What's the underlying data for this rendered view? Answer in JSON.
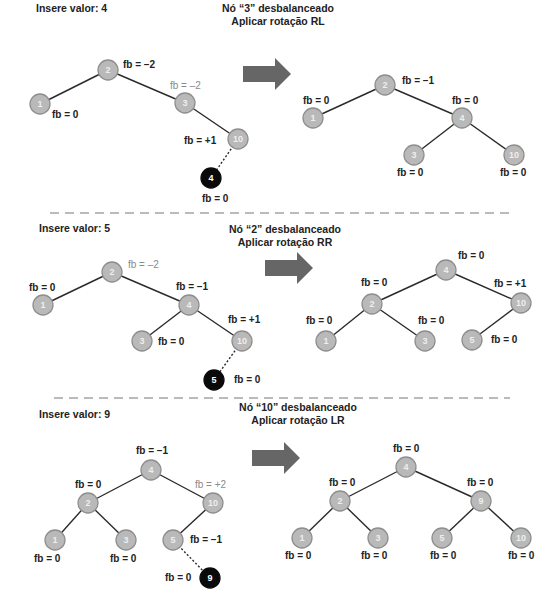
{
  "panels": [
    {
      "title": "Insere valor: 4",
      "heading_line1": "Nó “3” desbalanceado",
      "heading_line2": "Aplicar rotação RL",
      "before": {
        "nodes": [
          {
            "v": "2",
            "x": 108,
            "y": 70
          },
          {
            "v": "1",
            "x": 40,
            "y": 104
          },
          {
            "v": "3",
            "x": 185,
            "y": 103
          },
          {
            "v": "10",
            "x": 238,
            "y": 139
          },
          {
            "v": "4",
            "x": 211,
            "y": 178,
            "new": true
          }
        ],
        "edges": [
          [
            0,
            1
          ],
          [
            0,
            2
          ],
          [
            2,
            3
          ],
          [
            3,
            4,
            "dotted"
          ]
        ],
        "labels": [
          {
            "t": "fb = –2",
            "x": 123,
            "y": 68
          },
          {
            "t": "fb = –2",
            "x": 170,
            "y": 89,
            "grey": true
          },
          {
            "t": "fb = 0",
            "x": 52,
            "y": 118
          },
          {
            "t": "fb = +1",
            "x": 184,
            "y": 144
          },
          {
            "t": "fb = 0",
            "x": 202,
            "y": 202
          }
        ]
      },
      "after": {
        "nodes": [
          {
            "v": "2",
            "x": 385,
            "y": 85
          },
          {
            "v": "1",
            "x": 313,
            "y": 118
          },
          {
            "v": "4",
            "x": 462,
            "y": 118
          },
          {
            "v": "3",
            "x": 414,
            "y": 155
          },
          {
            "v": "10",
            "x": 514,
            "y": 155
          }
        ],
        "edges": [
          [
            0,
            1
          ],
          [
            0,
            2
          ],
          [
            2,
            3
          ],
          [
            2,
            4
          ]
        ],
        "labels": [
          {
            "t": "fb = –1",
            "x": 402,
            "y": 84
          },
          {
            "t": "fb = 0",
            "x": 303,
            "y": 104
          },
          {
            "t": "fb = 0",
            "x": 452,
            "y": 104
          },
          {
            "t": "fb = 0",
            "x": 397,
            "y": 176
          },
          {
            "t": "fb = 0",
            "x": 500,
            "y": 176
          }
        ]
      },
      "arrow": {
        "x": 243,
        "y": 58
      }
    },
    {
      "title": "Insere valor: 5",
      "heading_line1": "Nó “2” desbalanceado",
      "heading_line2": "Aplicar rotação RR",
      "before": {
        "nodes": [
          {
            "v": "2",
            "x": 112,
            "y": 272
          },
          {
            "v": "1",
            "x": 43,
            "y": 305
          },
          {
            "v": "4",
            "x": 189,
            "y": 305
          },
          {
            "v": "3",
            "x": 142,
            "y": 341
          },
          {
            "v": "10",
            "x": 242,
            "y": 341
          },
          {
            "v": "5",
            "x": 214,
            "y": 380,
            "new": true
          }
        ],
        "edges": [
          [
            0,
            1
          ],
          [
            0,
            2
          ],
          [
            2,
            3
          ],
          [
            2,
            4
          ],
          [
            4,
            5,
            "dotted"
          ]
        ],
        "labels": [
          {
            "t": "fb = –2",
            "x": 128,
            "y": 268,
            "grey": true
          },
          {
            "t": "fb = 0",
            "x": 29,
            "y": 291
          },
          {
            "t": "fb = –1",
            "x": 176,
            "y": 290
          },
          {
            "t": "fb = +1",
            "x": 228,
            "y": 323
          },
          {
            "t": "fb = 0",
            "x": 158,
            "y": 345
          },
          {
            "t": "fb = 0",
            "x": 234,
            "y": 383
          }
        ]
      },
      "after": {
        "nodes": [
          {
            "v": "4",
            "x": 446,
            "y": 270
          },
          {
            "v": "2",
            "x": 372,
            "y": 304
          },
          {
            "v": "10",
            "x": 521,
            "y": 303
          },
          {
            "v": "1",
            "x": 326,
            "y": 341
          },
          {
            "v": "3",
            "x": 425,
            "y": 341
          },
          {
            "v": "5",
            "x": 472,
            "y": 340
          }
        ],
        "edges": [
          [
            0,
            1
          ],
          [
            0,
            2
          ],
          [
            1,
            3
          ],
          [
            1,
            4
          ],
          [
            2,
            5
          ]
        ],
        "labels": [
          {
            "t": "fb = 0",
            "x": 458,
            "y": 259
          },
          {
            "t": "fb = 0",
            "x": 361,
            "y": 286
          },
          {
            "t": "fb = +1",
            "x": 494,
            "y": 287
          },
          {
            "t": "fb = 0",
            "x": 306,
            "y": 324
          },
          {
            "t": "fb = 0",
            "x": 418,
            "y": 324
          },
          {
            "t": "fb = 0",
            "x": 491,
            "y": 343
          }
        ]
      },
      "arrow": {
        "x": 265,
        "y": 252
      }
    },
    {
      "title": "Insere valor: 9",
      "heading_line1": "Nó “10” desbalanceado",
      "heading_line2": "Aplicar rotação LR",
      "before": {
        "nodes": [
          {
            "v": "4",
            "x": 151,
            "y": 470
          },
          {
            "v": "2",
            "x": 88,
            "y": 503
          },
          {
            "v": "10",
            "x": 213,
            "y": 503
          },
          {
            "v": "1",
            "x": 55,
            "y": 540
          },
          {
            "v": "3",
            "x": 126,
            "y": 540
          },
          {
            "v": "5",
            "x": 173,
            "y": 540
          },
          {
            "v": "9",
            "x": 210,
            "y": 578,
            "new": true
          }
        ],
        "edges": [
          [
            0,
            1
          ],
          [
            0,
            2
          ],
          [
            1,
            3
          ],
          [
            1,
            4
          ],
          [
            2,
            5
          ],
          [
            5,
            6,
            "dotted"
          ]
        ],
        "labels": [
          {
            "t": "fb = –1",
            "x": 136,
            "y": 454
          },
          {
            "t": "fb = 0",
            "x": 75,
            "y": 488
          },
          {
            "t": "fb = +2",
            "x": 195,
            "y": 488,
            "grey": true
          },
          {
            "t": "fb = –1",
            "x": 190,
            "y": 543
          },
          {
            "t": "fb = 0",
            "x": 34,
            "y": 562
          },
          {
            "t": "fb = 0",
            "x": 110,
            "y": 562
          },
          {
            "t": "fb = 0",
            "x": 165,
            "y": 581
          }
        ]
      },
      "after": {
        "nodes": [
          {
            "v": "4",
            "x": 406,
            "y": 467
          },
          {
            "v": "2",
            "x": 340,
            "y": 501
          },
          {
            "v": "9",
            "x": 481,
            "y": 501
          },
          {
            "v": "1",
            "x": 302,
            "y": 538
          },
          {
            "v": "3",
            "x": 378,
            "y": 538
          },
          {
            "v": "5",
            "x": 442,
            "y": 538
          },
          {
            "v": "10",
            "x": 521,
            "y": 538
          }
        ],
        "edges": [
          [
            0,
            1
          ],
          [
            0,
            2
          ],
          [
            1,
            3
          ],
          [
            1,
            4
          ],
          [
            2,
            5
          ],
          [
            2,
            6
          ]
        ],
        "labels": [
          {
            "t": "fb = 0",
            "x": 393,
            "y": 452
          },
          {
            "t": "fb = 0",
            "x": 329,
            "y": 486
          },
          {
            "t": "fb = 0",
            "x": 467,
            "y": 486
          },
          {
            "t": "fb = 0",
            "x": 285,
            "y": 559
          },
          {
            "t": "fb = 0",
            "x": 361,
            "y": 559
          },
          {
            "t": "fb = 0",
            "x": 430,
            "y": 559
          },
          {
            "t": "fb = 0",
            "x": 508,
            "y": 559
          }
        ]
      },
      "arrow": {
        "x": 252,
        "y": 442
      }
    }
  ],
  "title_positions": [
    {
      "x": 21,
      "y": 12
    },
    {
      "x": 24,
      "y": 232
    },
    {
      "x": 24,
      "y": 418
    }
  ],
  "heading_positions": [
    {
      "x": 278,
      "y": 40
    },
    {
      "x": 285,
      "y": 238
    },
    {
      "x": 298,
      "y": 416
    }
  ],
  "separators": [
    {
      "y": 213,
      "x1": 50,
      "x2": 510
    },
    {
      "y": 398,
      "x1": 54,
      "x2": 510
    }
  ],
  "colors": {
    "node_fill": "#b9b9b9",
    "node_new": "#0a0a0a",
    "arrow": "#666666",
    "unbalanced_label": "#8a8a8a"
  }
}
